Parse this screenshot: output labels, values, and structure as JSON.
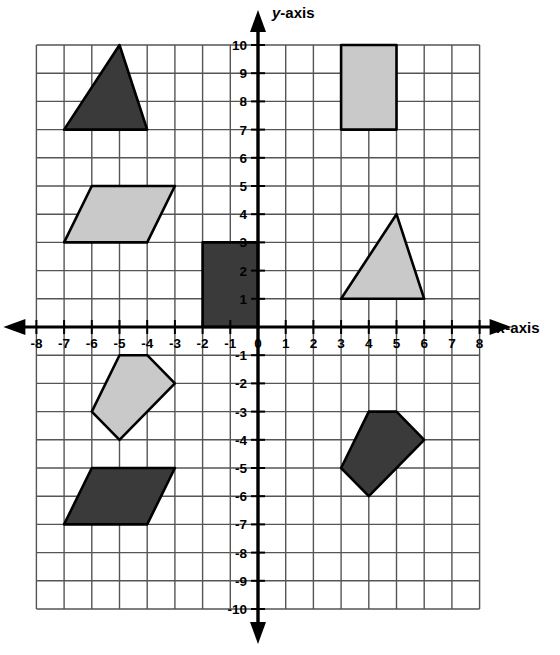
{
  "figure": {
    "background_color": "#ffffff"
  },
  "axes": {
    "x_label": "x-axis",
    "y_label": "y-axis",
    "x_label_italic_part": "x",
    "x_label_rest": "-axis",
    "y_label_italic_part": "y",
    "y_label_rest": "-axis",
    "x_min": -8,
    "x_max": 8,
    "y_min": -10,
    "y_max": 10,
    "axis_color": "#000000",
    "grid_color": "#555555",
    "grid_visible": true,
    "x_ticks": [
      "-8",
      "-7",
      "-6",
      "-5",
      "-4",
      "-3",
      "-2",
      "-1",
      "0",
      "1",
      "2",
      "3",
      "4",
      "5",
      "6",
      "7",
      "8"
    ],
    "y_ticks_positive": [
      "10",
      "9",
      "8",
      "7",
      "6",
      "5",
      "4",
      "3",
      "2",
      "1"
    ],
    "y_ticks_negative": [
      "-1",
      "-2",
      "-3",
      "-4",
      "-5",
      "-6",
      "-7",
      "-8",
      "-9",
      "-10"
    ],
    "origin_label": "0"
  },
  "palette": {
    "dark_fill": "#3a3a3a",
    "light_fill": "#c9c9c9",
    "outline": "#000000"
  },
  "chart_data": {
    "type": "scatter",
    "xlabel": "x-axis",
    "ylabel": "y-axis",
    "xlim": [
      -8,
      8
    ],
    "ylim": [
      -10,
      10
    ],
    "grid": true,
    "legend": "none",
    "shapes": [
      {
        "name": "dark-triangle-quadrant-2",
        "kind": "triangle",
        "fill": "dark",
        "quadrant": "II",
        "points": [
          [
            -7,
            7
          ],
          [
            -4,
            7
          ],
          [
            -5,
            10
          ]
        ]
      },
      {
        "name": "light-parallelogram-quadrant-2",
        "kind": "parallelogram",
        "fill": "light",
        "quadrant": "II",
        "points": [
          [
            -7,
            3
          ],
          [
            -4,
            3
          ],
          [
            -3,
            5
          ],
          [
            -6,
            5
          ]
        ]
      },
      {
        "name": "dark-rectangle-origin",
        "kind": "rectangle",
        "fill": "dark",
        "quadrant": "II",
        "points": [
          [
            -2,
            0
          ],
          [
            0,
            0
          ],
          [
            0,
            3
          ],
          [
            -2,
            3
          ]
        ]
      },
      {
        "name": "light-rectangle-quadrant-1",
        "kind": "rectangle",
        "fill": "light",
        "quadrant": "I",
        "points": [
          [
            3,
            7
          ],
          [
            5,
            7
          ],
          [
            5,
            10
          ],
          [
            3,
            10
          ]
        ]
      },
      {
        "name": "light-triangle-quadrant-1",
        "kind": "triangle",
        "fill": "light",
        "quadrant": "I",
        "points": [
          [
            3,
            1
          ],
          [
            6,
            1
          ],
          [
            5,
            4
          ]
        ]
      },
      {
        "name": "light-pentagon-quadrant-3",
        "kind": "pentagon",
        "fill": "light",
        "quadrant": "III",
        "points": [
          [
            -5,
            -1
          ],
          [
            -4,
            -1
          ],
          [
            -3,
            -2
          ],
          [
            -5,
            -4
          ],
          [
            -6,
            -3
          ]
        ]
      },
      {
        "name": "dark-parallelogram-quadrant-3",
        "kind": "parallelogram",
        "fill": "dark",
        "quadrant": "III",
        "points": [
          [
            -7,
            -7
          ],
          [
            -4,
            -7
          ],
          [
            -3,
            -5
          ],
          [
            -6,
            -5
          ]
        ]
      },
      {
        "name": "dark-pentagon-quadrant-4",
        "kind": "pentagon",
        "fill": "dark",
        "quadrant": "IV",
        "points": [
          [
            4,
            -3
          ],
          [
            5,
            -3
          ],
          [
            6,
            -4
          ],
          [
            4,
            -6
          ],
          [
            3,
            -5
          ]
        ]
      }
    ]
  }
}
